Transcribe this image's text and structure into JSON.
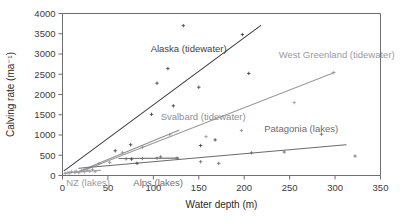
{
  "chart_data": {
    "type": "scatter",
    "title": "",
    "xlabel": "Water depth (m)",
    "ylabel": "Calving rate (ma⁻¹)",
    "xlim": [
      0,
      350
    ],
    "ylim": [
      0,
      4000
    ],
    "xticks": [
      0,
      50,
      100,
      150,
      200,
      250,
      300,
      350
    ],
    "yticks": [
      0,
      500,
      1000,
      1500,
      2000,
      2500,
      3000,
      3500,
      4000
    ],
    "grid": false,
    "legend_position": "inline-annotations",
    "series": [
      {
        "name": "Alaska (tidewater)",
        "label": "Alaska (tidewater)",
        "color": "#3f3f46",
        "label_x": 97,
        "label_y": 3060,
        "trendline": {
          "x0": 2,
          "y0": 120,
          "x1": 218,
          "y1": 3700
        },
        "points": [
          [
            58,
            610
          ],
          [
            75,
            760
          ],
          [
            76,
            405
          ],
          [
            82,
            300
          ],
          [
            98,
            1510
          ],
          [
            104,
            2280
          ],
          [
            116,
            2640
          ],
          [
            122,
            1720
          ],
          [
            133,
            3700
          ],
          [
            150,
            2180
          ],
          [
            152,
            740
          ],
          [
            168,
            880
          ],
          [
            198,
            3480
          ],
          [
            205,
            2520
          ]
        ]
      },
      {
        "name": "West Greenland (tidewater)",
        "label": "West Greenland (tidewater)",
        "color": "#9a9aa0",
        "label_x": 238,
        "label_y": 2900,
        "trendline": {
          "x0": 18,
          "y0": 80,
          "x1": 300,
          "y1": 2550
        },
        "points": [
          [
            118,
            1010
          ],
          [
            158,
            960
          ],
          [
            197,
            1110
          ],
          [
            255,
            1800
          ],
          [
            298,
            2540
          ]
        ]
      },
      {
        "name": "Svalbard (tidewater)",
        "label": "Svalbard (tidewater)",
        "color": "#8f8f95",
        "label_x": 108,
        "label_y": 1380,
        "trendline": {
          "x0": 14,
          "y0": 60,
          "x1": 128,
          "y1": 1120
        },
        "points": [
          [
            28,
            180
          ],
          [
            40,
            290
          ],
          [
            52,
            320
          ],
          [
            66,
            560
          ],
          [
            88,
            700
          ]
        ]
      },
      {
        "name": "Patagonia (lakes)",
        "label": "Patagonia (lakes)",
        "color": "#6b6b70",
        "label_x": 222,
        "label_y": 1080,
        "trendline": {
          "x0": 18,
          "y0": 180,
          "x1": 312,
          "y1": 760
        },
        "points": [
          [
            108,
            460
          ],
          [
            126,
            430
          ],
          [
            152,
            340
          ],
          [
            172,
            300
          ],
          [
            208,
            560
          ],
          [
            244,
            580
          ],
          [
            285,
            1020
          ],
          [
            322,
            480
          ]
        ]
      },
      {
        "name": "Alps (lakes)",
        "label": "Alps (lakes)",
        "color": "#6f6f74",
        "label_x": 78,
        "label_y": -250,
        "trendline": {
          "x0": 62,
          "y0": 420,
          "x1": 128,
          "y1": 430
        },
        "points": [
          [
            70,
            410
          ],
          [
            88,
            420
          ],
          [
            104,
            430
          ]
        ]
      },
      {
        "name": "NZ (lakes)",
        "label": "NZ (lakes)",
        "color": "#9a9aa0",
        "label_x": 4,
        "label_y": -250,
        "trendline": {
          "x0": 2,
          "y0": 60,
          "x1": 42,
          "y1": 130
        },
        "points": [
          [
            3,
            50
          ],
          [
            6,
            70
          ],
          [
            8,
            60
          ],
          [
            10,
            95
          ],
          [
            13,
            80
          ],
          [
            15,
            110
          ],
          [
            18,
            70
          ],
          [
            21,
            120
          ],
          [
            24,
            90
          ],
          [
            27,
            130
          ],
          [
            30,
            105
          ],
          [
            33,
            150
          ],
          [
            36,
            95
          ]
        ]
      }
    ]
  }
}
